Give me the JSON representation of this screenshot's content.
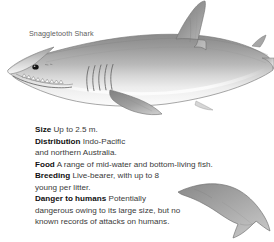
{
  "caption": {
    "species_name": "Snaggletooth Shark"
  },
  "facts": [
    {
      "label": "Size",
      "value": "Up to 2.5 m."
    },
    {
      "label": "Distribution",
      "value": "Indo-Pacific"
    },
    {
      "label": "",
      "value": "and northern Australia."
    },
    {
      "label": "Food",
      "value": "A range of mid-water and bottom-living fish."
    },
    {
      "label": "Breeding",
      "value": "Live-bearer, with up to 8"
    },
    {
      "label": "",
      "value": "young per litter."
    },
    {
      "label": "Danger to humans",
      "value": "Potentially"
    },
    {
      "label": "",
      "value": "dangerous owing to its large size, but no"
    },
    {
      "label": "",
      "value": "known records of attacks on humans."
    }
  ],
  "illustration": {
    "main_figure": "shark-lateral-view",
    "detail_figure": "caudal-fin-detail",
    "background_color": "#ffffff",
    "dorsal_color": "#8d8d8d",
    "midbody_color": "#b4b4b4",
    "ventral_color": "#fbfbfb",
    "outline_color": "#6f6f6f",
    "eye_color": "#1a1a1a"
  }
}
